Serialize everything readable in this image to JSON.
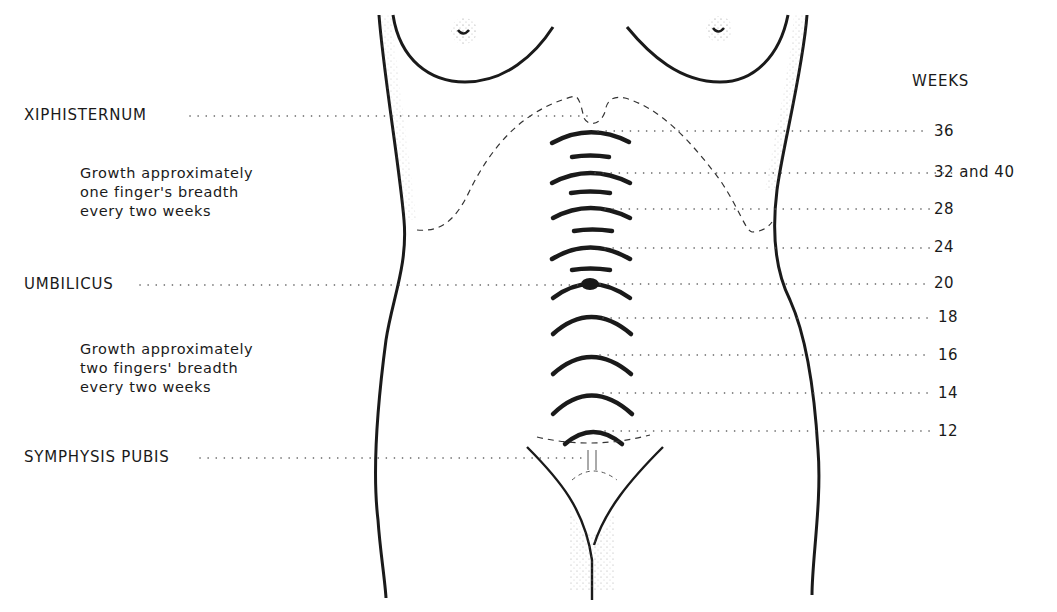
{
  "diagram": {
    "title_column": "WEEKS",
    "landmarks": [
      {
        "label": "XIPHISTERNUM",
        "y": 116
      },
      {
        "label": "UMBILICUS",
        "y": 285
      },
      {
        "label": "SYMPHYSIS PUBIS",
        "y": 458
      }
    ],
    "notes": [
      {
        "text": "Growth approximately\none finger's breadth\nevery two weeks"
      },
      {
        "text": "Growth approximately\ntwo fingers' breadth\nevery two weeks"
      }
    ],
    "weeks": [
      {
        "label": "36",
        "y": 132
      },
      {
        "label": "32 and 40",
        "y": 173
      },
      {
        "label": "28",
        "y": 210
      },
      {
        "label": "24",
        "y": 248
      },
      {
        "label": "20",
        "y": 284
      },
      {
        "label": "18",
        "y": 318
      },
      {
        "label": "16",
        "y": 356
      },
      {
        "label": "14",
        "y": 394
      },
      {
        "label": "12",
        "y": 432
      }
    ],
    "colors": {
      "ink": "#1a1a1a",
      "dots": "#555555",
      "background": "#ffffff"
    }
  }
}
